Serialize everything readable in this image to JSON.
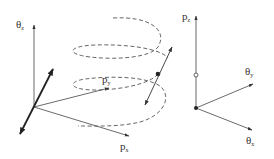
{
  "figure": {
    "left_panel": {
      "axes": {
        "theta_z": {
          "symbol": "θ",
          "subscript": "z"
        },
        "p_y": {
          "symbol": "p",
          "subscript": "y"
        },
        "p_x": {
          "symbol": "p",
          "subscript": "x"
        }
      },
      "elements": [
        "helical dashed trajectory",
        "particle dot on helix",
        "tangent double-arrow at particle",
        "thick double-arrow at origin"
      ]
    },
    "right_panel": {
      "axes": {
        "p_z": {
          "symbol": "p",
          "subscript": "z"
        },
        "theta_y": {
          "symbol": "θ",
          "subscript": "y"
        },
        "theta_x": {
          "symbol": "θ",
          "subscript": "x"
        }
      },
      "elements": [
        "filled dot at origin",
        "open circle on p_z axis"
      ]
    },
    "colors": {
      "line": "#444444",
      "thick_arrow": "#222222",
      "background": "#ffffff"
    }
  }
}
